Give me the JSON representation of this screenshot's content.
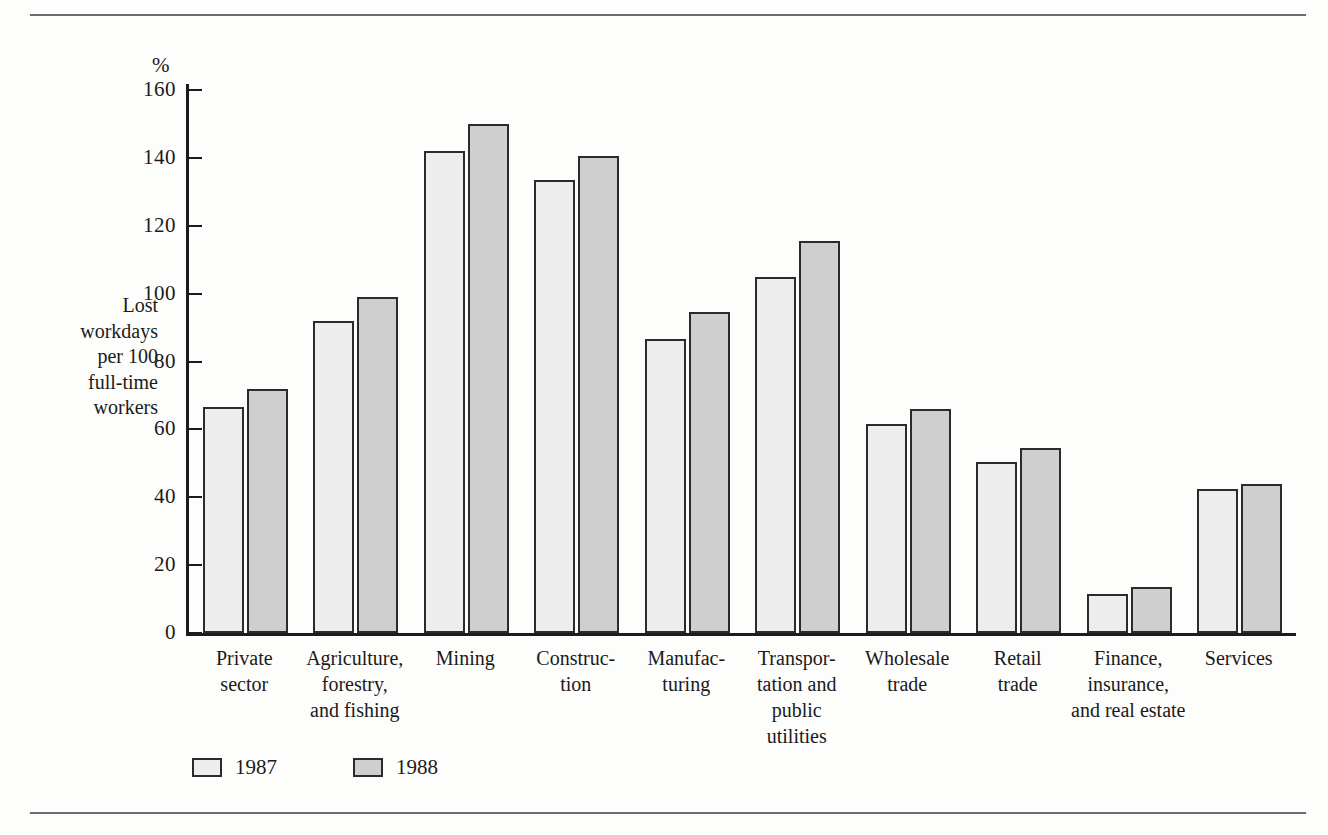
{
  "chart_data": {
    "type": "bar",
    "title": "",
    "subtitle": "",
    "xlabel": "",
    "ylabel": "Lost\nworkdays\nper 100\nfull-time\nworkers",
    "unit_symbol": "%",
    "ylim": [
      0,
      160
    ],
    "ytick_values": [
      0,
      20,
      40,
      60,
      80,
      100,
      120,
      140,
      160
    ],
    "ytick_labels": [
      "0",
      "20",
      "40",
      "60",
      "80",
      "100",
      "120",
      "140",
      "160"
    ],
    "grid": false,
    "legend_position": "bottom-left",
    "categories": [
      "Private\nsector",
      "Agriculture,\nforestry,\nand fishing",
      "Mining",
      "Construc-\ntion",
      "Manufac-\nturing",
      "Transpor-\ntation and\npublic\nutilities",
      "Wholesale\ntrade",
      "Retail\ntrade",
      "Finance,\ninsurance,\nand real estate",
      "Services"
    ],
    "series": [
      {
        "name": "1987",
        "color": "#ededed",
        "values": [
          66.5,
          92,
          142,
          133.5,
          86.5,
          105,
          61.5,
          50.5,
          11.5,
          42.5
        ]
      },
      {
        "name": "1988",
        "color": "#cfcfcf",
        "values": [
          72,
          99,
          150,
          140.5,
          94.5,
          115.5,
          66,
          54.5,
          13.5,
          44
        ]
      }
    ]
  },
  "legend": {
    "items": [
      {
        "label": "1987"
      },
      {
        "label": "1988"
      }
    ]
  },
  "colors": {
    "series_1987": "#ededed",
    "series_1988": "#cfcfcf",
    "axis": "#1c1c1c",
    "bar_outline": "#2b2b2b",
    "rule": "#6b6b6b",
    "background": "#fdfdfc"
  }
}
